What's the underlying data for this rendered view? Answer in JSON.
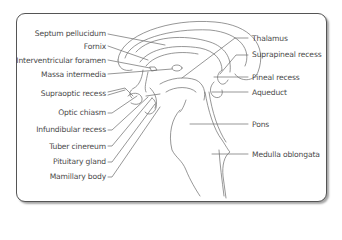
{
  "diagram": {
    "left_labels": [
      {
        "text": "Septum pellucidum"
      },
      {
        "text": "Fornix"
      },
      {
        "text": "Interventricular foramen"
      },
      {
        "text": "Massa intermedia"
      },
      {
        "text": "Supraoptic recess"
      },
      {
        "text": "Optic chiasm"
      },
      {
        "text": "Infundibular recess"
      },
      {
        "text": "Tuber cinereum"
      },
      {
        "text": "Pituitary gland"
      },
      {
        "text": "Mamillary body"
      }
    ],
    "right_labels": [
      {
        "text": "Thalamus"
      },
      {
        "text": "Suprapineal recess"
      },
      {
        "text": "Pineal recess"
      },
      {
        "text": "Aqueduct"
      },
      {
        "text": "Pons"
      },
      {
        "text": "Medulla oblongata"
      }
    ],
    "colors": {
      "line": "#6a6a6a",
      "text": "#4a4a4a",
      "frame": "#555555"
    }
  }
}
